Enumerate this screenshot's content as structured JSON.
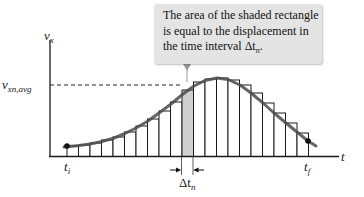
{
  "callout": {
    "lines": [
      "The area of the shaded rectangle",
      "is equal to the displacement in",
      "the time interval Δt"
    ],
    "line3_subscript": "n",
    "line3_suffix": "."
  },
  "axes": {
    "y_label": "v",
    "y_label_sub": "x",
    "x_label": "t"
  },
  "labels": {
    "avg_label": "v",
    "avg_label_sub": "xn,avg",
    "t_initial": "t",
    "t_initial_sub": "i",
    "t_final": "t",
    "t_final_sub": "f",
    "delta_t": "Δt",
    "delta_t_sub": "n"
  },
  "colors": {
    "curve": "#4a4a4a",
    "bar_stroke": "#1a1a1a",
    "shaded_bar": "#cfcfcf",
    "callout_bg": "#e4e4e4",
    "axis": "#1a1a1a"
  },
  "diagram": {
    "bar_count": 21,
    "shaded_bar_index": 10,
    "bar_tops_px": [
      146,
      145,
      143,
      140,
      137,
      132,
      126,
      119,
      111,
      102,
      90,
      82,
      79,
      78,
      80,
      85,
      93,
      103,
      113,
      123,
      133
    ],
    "curve_points_px": [
      [
        64,
        147
      ],
      [
        79,
        145.5
      ],
      [
        90,
        144
      ],
      [
        102,
        141.5
      ],
      [
        114,
        138
      ],
      [
        125,
        133.5
      ],
      [
        136,
        128
      ],
      [
        148,
        121
      ],
      [
        159,
        113
      ],
      [
        171,
        104
      ],
      [
        183,
        94
      ],
      [
        194,
        86
      ],
      [
        205,
        80.5
      ],
      [
        217,
        78
      ],
      [
        228,
        79.5
      ],
      [
        240,
        85
      ],
      [
        251,
        93
      ],
      [
        263,
        103
      ],
      [
        274,
        113
      ],
      [
        286,
        123
      ],
      [
        297,
        132
      ],
      [
        308,
        141
      ],
      [
        316,
        146
      ]
    ]
  }
}
